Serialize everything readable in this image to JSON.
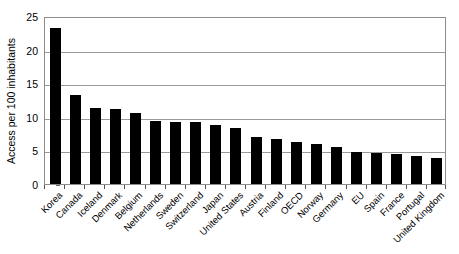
{
  "chart_data": {
    "type": "bar",
    "title": "",
    "subtitle": "",
    "xlabel": "",
    "ylabel": "Access per 100 inhabitants",
    "ylim": [
      0,
      25
    ],
    "ytick_values": [
      0,
      5,
      10,
      15,
      20,
      25
    ],
    "ytick_labels": [
      "0",
      "5",
      "10",
      "15",
      "20",
      "25"
    ],
    "grid": "horizontal",
    "legend": "none",
    "bar_color": "#000000",
    "gridline_color": "#9a9a9a",
    "frame_color": "#8d8d8d",
    "background_color": "#ffffff",
    "categories": [
      "Korea",
      "Canada",
      "Iceland",
      "Denmark",
      "Belgium",
      "Netherlands",
      "Sweden",
      "Switzerland",
      "Japan",
      "United States",
      "Austria",
      "Finland",
      "OECD",
      "Norway",
      "Germany",
      "EU",
      "Spain",
      "France",
      "Portugal",
      "United Kingdom"
    ],
    "values": [
      23.2,
      13.3,
      11.3,
      11.2,
      10.5,
      9.4,
      9.3,
      9.2,
      8.8,
      8.3,
      7.0,
      6.7,
      6.3,
      5.9,
      5.5,
      4.8,
      4.6,
      4.4,
      4.1,
      3.9
    ],
    "value_labels": [
      "23.2",
      "13.3",
      "11.3",
      "11.2",
      "10.5",
      "9.4",
      "9.3",
      "9.2",
      "8.8",
      "8.3",
      "7.0",
      "6.7",
      "6.3",
      "5.9",
      "5.5",
      "4.8",
      "4.6",
      "4.4",
      "4.1",
      "3.9"
    ]
  }
}
